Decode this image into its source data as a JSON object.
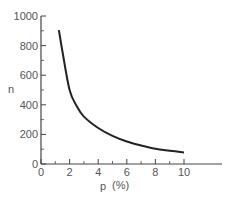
{
  "chart_data": {
    "type": "line",
    "title": "",
    "xlabel": "p (%)",
    "ylabel": "n",
    "xlim": [
      0,
      12
    ],
    "ylim": [
      0,
      1000
    ],
    "grid": false,
    "legend": null,
    "x_ticks": [
      0,
      2,
      4,
      6,
      8,
      10
    ],
    "x_minor_ticks": [
      1,
      3,
      5,
      7,
      9
    ],
    "y_ticks": [
      0,
      200,
      400,
      600,
      800,
      1000
    ],
    "y_minor_ticks": [
      100,
      300,
      500,
      700,
      900
    ],
    "series": [
      {
        "name": "n vs p",
        "color": "#222222",
        "x": [
          1.25,
          1.5,
          2,
          2.5,
          3,
          4,
          5,
          6,
          7,
          8,
          9,
          10
        ],
        "y": [
          905,
          760,
          500,
          390,
          320,
          243,
          190,
          152,
          125,
          103,
          90,
          78
        ]
      }
    ]
  },
  "axes": {
    "x_title_main": "p",
    "x_title_unit": "(%)",
    "y_title": "n",
    "x_tick_labels": [
      "0",
      "2",
      "4",
      "6",
      "8",
      "10"
    ],
    "y_tick_labels": [
      "0",
      "200",
      "400",
      "600",
      "800",
      "1000"
    ]
  },
  "colors": {
    "axis": "#444444",
    "curve": "#222222",
    "text": "#555555"
  }
}
